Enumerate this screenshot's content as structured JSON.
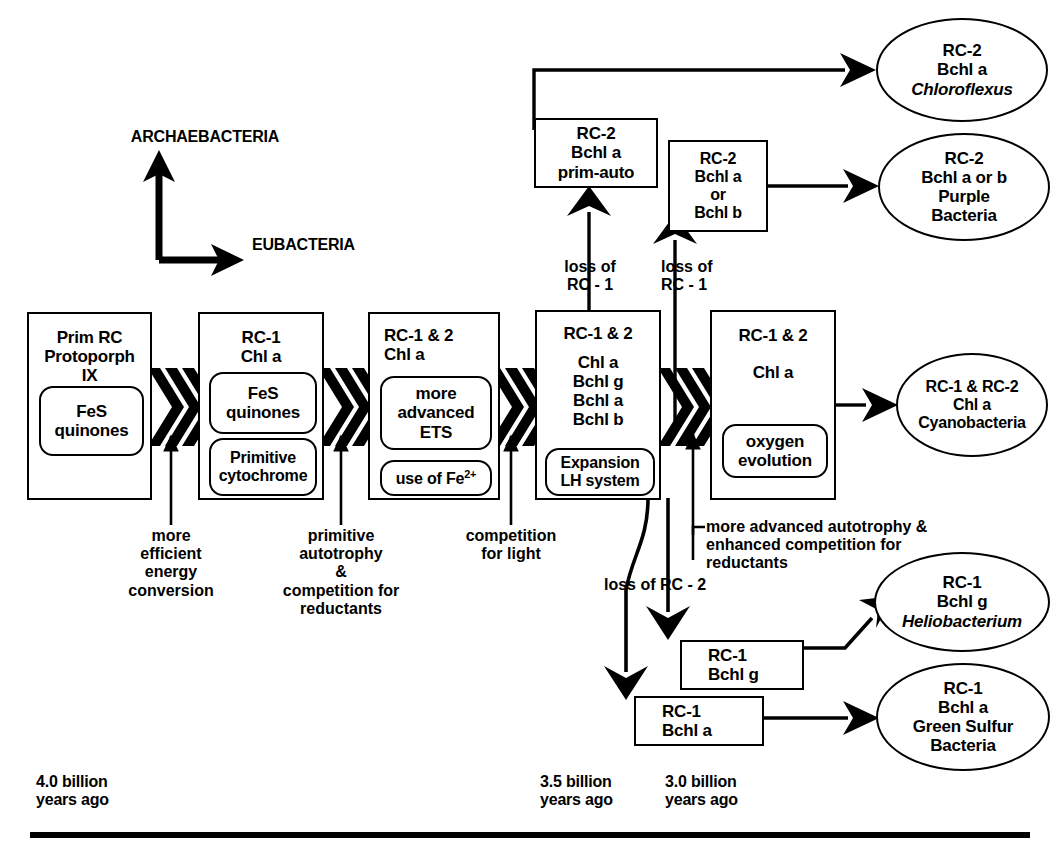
{
  "title_labels": {
    "archaebacteria": "ARCHAEBACTERIA",
    "eubacteria": "EUBACTERIA"
  },
  "stage_boxes": [
    {
      "id": "box-prim-rc",
      "header": [
        "Prim RC",
        "Protoporph",
        "IX"
      ],
      "inner": [
        {
          "id": "fes-quinones-1",
          "lines": [
            "FeS",
            "quinones"
          ]
        }
      ]
    },
    {
      "id": "box-rc1-chla",
      "header": [
        "RC-1",
        "Chl a"
      ],
      "inner": [
        {
          "id": "fes-quinones-2",
          "lines": [
            "FeS",
            "quinones"
          ]
        },
        {
          "id": "primitive-cytochrome",
          "lines": [
            "Primitive",
            "cytochrome"
          ]
        }
      ]
    },
    {
      "id": "box-rc12-chla",
      "header": [
        "RC-1 & 2",
        "Chl a"
      ],
      "inner": [
        {
          "id": "more-advanced-ets",
          "lines": [
            "more",
            "advanced",
            "ETS"
          ]
        },
        {
          "id": "use-of-fe",
          "lines": [
            "use of Fe2+"
          ]
        }
      ]
    },
    {
      "id": "box-rc12-pigments",
      "header": [
        "RC-1 & 2"
      ],
      "body": [
        "Chl a",
        "Bchl g",
        "Bchl a",
        "Bchl b"
      ],
      "inner": [
        {
          "id": "expansion-lh-system",
          "lines": [
            "Expansion",
            "LH system"
          ]
        }
      ]
    },
    {
      "id": "box-rc12-oxygen",
      "header": [
        "RC-1 & 2"
      ],
      "body": [
        "Chl a"
      ],
      "inner": [
        {
          "id": "oxygen-evolution",
          "lines": [
            "oxygen",
            "evolution"
          ]
        }
      ]
    }
  ],
  "upper_boxes": {
    "rc2_prim_auto": [
      "RC-2",
      "Bchl a",
      "prim-auto"
    ],
    "rc2_bchl_a_or_b": [
      "RC-2",
      "Bchl a",
      "or",
      "Bchl b"
    ]
  },
  "lower_boxes": {
    "rc1_bchl_g": [
      "RC-1",
      "Bchl g"
    ],
    "rc1_bchl_a": [
      "RC-1",
      "Bchl a"
    ]
  },
  "outcomes": [
    {
      "id": "chloroflexus",
      "lines": [
        "RC-2",
        "Bchl a"
      ],
      "italic": "Chloroflexus"
    },
    {
      "id": "purple-bacteria",
      "lines": [
        "RC-2",
        "Bchl a or b",
        "Purple",
        "Bacteria"
      ],
      "italic": ""
    },
    {
      "id": "cyanobacteria",
      "lines": [
        "RC-1 & RC-2",
        "Chl a",
        "Cyanobacteria"
      ],
      "italic": ""
    },
    {
      "id": "heliobacterium",
      "lines": [
        "RC-1",
        "Bchl g"
      ],
      "italic": "Heliobacterium"
    },
    {
      "id": "green-sulfur",
      "lines": [
        "RC-1",
        "Bchl a",
        "Green Sulfur",
        "Bacteria"
      ],
      "italic": ""
    }
  ],
  "transition_labels": {
    "more_efficient_energy": [
      "more",
      "efficient",
      "energy",
      "conversion"
    ],
    "primitive_autotrophy": [
      "primitive",
      "autotrophy",
      "&",
      "competition for",
      "reductants"
    ],
    "competition_for_light": [
      "competition",
      "for light"
    ],
    "loss_of_rc1_a": [
      "loss of",
      "RC - 1"
    ],
    "loss_of_rc1_b": [
      "loss of",
      "RC - 1"
    ],
    "loss_of_rc2": [
      "loss of RC - 2"
    ],
    "more_advanced_autotrophy": [
      "more advanced autotrophy &",
      "enhanced competition for",
      "reductants"
    ]
  },
  "timeline": [
    {
      "id": "t-4-0",
      "lines": [
        "4.0 billion",
        "years ago"
      ]
    },
    {
      "id": "t-3-5",
      "lines": [
        "3.5 billion",
        "years ago"
      ]
    },
    {
      "id": "t-3-0",
      "lines": [
        "3.0 billion",
        "years ago"
      ]
    }
  ],
  "colors": {
    "ink": "#000000",
    "paper": "#ffffff"
  },
  "icons": {
    "chevron": "triple-chevron-icon",
    "arrow": "arrow-icon"
  }
}
